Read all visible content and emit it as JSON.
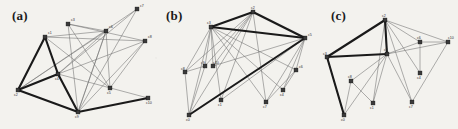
{
  "figure": {
    "background_color": "#f3f2ee",
    "thin_edge_color": "#6e6e6e",
    "thick_edge_color": "#1a1a1a",
    "node_fill": "#3a3a3a",
    "node_stroke": "#111111",
    "width": 458,
    "height": 129
  },
  "panels": [
    {
      "id": "a",
      "label": "(a)",
      "label_x": 12,
      "label_y": 8,
      "origin_x": 0,
      "nodes": [
        {
          "id": "c1",
          "label": "c1",
          "x": 45,
          "y": 37,
          "lx": 48,
          "ly": 34
        },
        {
          "id": "c2",
          "label": "c2",
          "x": 18,
          "y": 90,
          "lx": 14,
          "ly": 96
        },
        {
          "id": "c3",
          "label": "c3",
          "x": 68,
          "y": 24,
          "lx": 71,
          "ly": 21
        },
        {
          "id": "c4",
          "label": "c4",
          "x": 58,
          "y": 74,
          "lx": 55,
          "ly": 80
        },
        {
          "id": "c5",
          "label": "c5",
          "x": 110,
          "y": 88,
          "lx": 107,
          "ly": 94
        },
        {
          "id": "c6",
          "label": "c6",
          "x": 106,
          "y": 31,
          "lx": 109,
          "ly": 28
        },
        {
          "id": "c7",
          "label": "c7",
          "x": 137,
          "y": 9,
          "lx": 140,
          "ly": 7
        },
        {
          "id": "c8",
          "label": "c8",
          "x": 145,
          "y": 41,
          "lx": 148,
          "ly": 38
        },
        {
          "id": "c9",
          "label": "c9",
          "x": 78,
          "y": 112,
          "lx": 75,
          "ly": 118
        },
        {
          "id": "c10",
          "label": "c10",
          "x": 148,
          "y": 98,
          "lx": 146,
          "ly": 104
        }
      ],
      "thin_edges": [
        [
          "c3",
          "c5"
        ],
        [
          "c3",
          "c9"
        ],
        [
          "c3",
          "c6"
        ],
        [
          "c3",
          "c8"
        ],
        [
          "c1",
          "c6"
        ],
        [
          "c1",
          "c5"
        ],
        [
          "c1",
          "c8"
        ],
        [
          "c4",
          "c7"
        ],
        [
          "c4",
          "c6"
        ],
        [
          "c4",
          "c8"
        ],
        [
          "c4",
          "c10"
        ],
        [
          "c6",
          "c9"
        ],
        [
          "c6",
          "c5"
        ],
        [
          "c7",
          "c9"
        ],
        [
          "c7",
          "c2"
        ],
        [
          "c9",
          "c8"
        ],
        [
          "c9",
          "c6"
        ],
        [
          "c2",
          "c6"
        ],
        [
          "c5",
          "c8"
        ]
      ],
      "thick_edges": [
        [
          "c1",
          "c2"
        ],
        [
          "c1",
          "c4"
        ],
        [
          "c2",
          "c4"
        ],
        [
          "c2",
          "c9"
        ],
        [
          "c4",
          "c9"
        ],
        [
          "c9",
          "c10"
        ]
      ]
    },
    {
      "id": "b",
      "label": "(b)",
      "label_x": 166,
      "label_y": 8,
      "origin_x": 153,
      "nodes": [
        {
          "id": "c2",
          "label": "c2",
          "x": 100,
          "y": 12,
          "lx": 98,
          "ly": 9
        },
        {
          "id": "c3",
          "label": "c3",
          "x": 58,
          "y": 27,
          "lx": 54,
          "ly": 24
        },
        {
          "id": "c5",
          "label": "c5",
          "x": 152,
          "y": 38,
          "lx": 155,
          "ly": 36
        },
        {
          "id": "c8",
          "label": "c8",
          "x": 32,
          "y": 72,
          "lx": 28,
          "ly": 70
        },
        {
          "id": "c9",
          "label": "c9",
          "x": 52,
          "y": 66,
          "lx": 48,
          "ly": 64
        },
        {
          "id": "c10",
          "label": "c10",
          "x": 60,
          "y": 66,
          "lx": 60,
          "ly": 64
        },
        {
          "id": "c6",
          "label": "c6",
          "x": 143,
          "y": 70,
          "lx": 146,
          "ly": 68
        },
        {
          "id": "c4",
          "label": "c4",
          "x": 130,
          "y": 90,
          "lx": 127,
          "ly": 96
        },
        {
          "id": "c1",
          "label": "c1",
          "x": 68,
          "y": 100,
          "lx": 65,
          "ly": 106
        },
        {
          "id": "c7",
          "label": "c7",
          "x": 113,
          "y": 102,
          "lx": 110,
          "ly": 108
        },
        {
          "id": "c0",
          "label": "c0",
          "x": 36,
          "y": 115,
          "lx": 33,
          "ly": 121
        }
      ],
      "thin_edges": [
        [
          "c3",
          "c9"
        ],
        [
          "c3",
          "c10"
        ],
        [
          "c3",
          "c8"
        ],
        [
          "c3",
          "c1"
        ],
        [
          "c3",
          "c7"
        ],
        [
          "c3",
          "c4"
        ],
        [
          "c3",
          "c6"
        ],
        [
          "c3",
          "c0"
        ],
        [
          "c2",
          "c9"
        ],
        [
          "c2",
          "c10"
        ],
        [
          "c2",
          "c1"
        ],
        [
          "c2",
          "c7"
        ],
        [
          "c2",
          "c0"
        ],
        [
          "c2",
          "c8"
        ],
        [
          "c10",
          "c5"
        ],
        [
          "c9",
          "c0"
        ],
        [
          "c8",
          "c0"
        ],
        [
          "c9",
          "c8"
        ],
        [
          "c5",
          "c6"
        ],
        [
          "c5",
          "c4"
        ],
        [
          "c5",
          "c7"
        ],
        [
          "c6",
          "c4"
        ],
        [
          "c1",
          "c5"
        ],
        [
          "c7",
          "c6"
        ]
      ],
      "thick_edges": [
        [
          "c3",
          "c2"
        ],
        [
          "c3",
          "c5"
        ],
        [
          "c2",
          "c5"
        ],
        [
          "c5",
          "c0"
        ]
      ]
    },
    {
      "id": "c",
      "label": "(c)",
      "label_x": 331,
      "label_y": 8,
      "origin_x": 305,
      "nodes": [
        {
          "id": "c2",
          "label": "c2",
          "x": 80,
          "y": 20,
          "lx": 77,
          "ly": 17
        },
        {
          "id": "c3",
          "label": "c3",
          "x": 22,
          "y": 57,
          "lx": 18,
          "ly": 55
        },
        {
          "id": "c5",
          "label": "c5",
          "x": 82,
          "y": 54,
          "lx": 79,
          "ly": 51
        },
        {
          "id": "c6",
          "label": "c6",
          "x": 115,
          "y": 42,
          "lx": 112,
          "ly": 39
        },
        {
          "id": "c10",
          "label": "c10",
          "x": 143,
          "y": 42,
          "lx": 143,
          "ly": 39
        },
        {
          "id": "c4",
          "label": "c4",
          "x": 115,
          "y": 73,
          "lx": 112,
          "ly": 79
        },
        {
          "id": "c8",
          "label": "c8",
          "x": 46,
          "y": 81,
          "lx": 43,
          "ly": 78
        },
        {
          "id": "c1",
          "label": "c1",
          "x": 68,
          "y": 103,
          "lx": 65,
          "ly": 109
        },
        {
          "id": "c7",
          "label": "c7",
          "x": 107,
          "y": 102,
          "lx": 104,
          "ly": 108
        },
        {
          "id": "c0",
          "label": "c0",
          "x": 39,
          "y": 115,
          "lx": 36,
          "ly": 121
        }
      ],
      "thin_edges": [
        [
          "c2",
          "c6"
        ],
        [
          "c2",
          "c10"
        ],
        [
          "c2",
          "c4"
        ],
        [
          "c2",
          "c7"
        ],
        [
          "c2",
          "c1"
        ],
        [
          "c2",
          "c5"
        ],
        [
          "c5",
          "c6"
        ],
        [
          "c5",
          "c10"
        ],
        [
          "c5",
          "c7"
        ],
        [
          "c5",
          "c1"
        ],
        [
          "c5",
          "c8"
        ],
        [
          "c5",
          "c0"
        ],
        [
          "c6",
          "c4"
        ],
        [
          "c6",
          "c10"
        ],
        [
          "c10",
          "c7"
        ],
        [
          "c8",
          "c1"
        ],
        [
          "c8",
          "c0"
        ],
        [
          "c3",
          "c0"
        ]
      ],
      "thick_edges": [
        [
          "c2",
          "c3"
        ],
        [
          "c3",
          "c5"
        ],
        [
          "c2",
          "c5"
        ],
        [
          "c3",
          "c0"
        ]
      ]
    }
  ]
}
